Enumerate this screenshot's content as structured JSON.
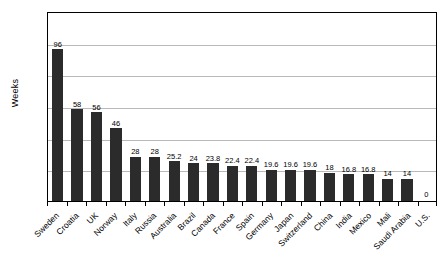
{
  "chart_data": {
    "type": "bar",
    "title": "",
    "subtitle": "",
    "xlabel": "",
    "ylabel": "Weeks",
    "ylim": [
      0,
      120
    ],
    "ytick_step": 20,
    "yticks": [
      "120",
      "100",
      "80",
      "60",
      "40",
      "20",
      "0"
    ],
    "grid": true,
    "legend": "none",
    "bar_color": "#2b2b2b",
    "categories": [
      "Sweden",
      "Croatia",
      "UK",
      "Norway",
      "Italy",
      "Russia",
      "Australia",
      "Brazil",
      "Canada",
      "France",
      "Spain",
      "Germany",
      "Japan",
      "Switzerland",
      "China",
      "India",
      "Mexico",
      "Mali",
      "Saudi Arabia",
      "U.S."
    ],
    "values": [
      96,
      58,
      56,
      46,
      28,
      28,
      25.2,
      24,
      23.8,
      22.4,
      22.4,
      19.6,
      19.6,
      19.6,
      18,
      16.8,
      16.8,
      14,
      14,
      0
    ],
    "value_labels": [
      "96",
      "58",
      "56",
      "46",
      "28",
      "28",
      "25.2",
      "24",
      "23.8",
      "22.4",
      "22.4",
      "19.6",
      "19.6",
      "19.6",
      "18",
      "16.8",
      "16.8",
      "14",
      "14",
      "0"
    ]
  }
}
